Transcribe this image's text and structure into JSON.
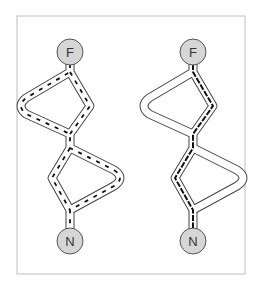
{
  "colors": {
    "frame": "#bdbdbd",
    "node_fill": "#d6d6d6",
    "node_stroke": "#555555",
    "tube": "#444444",
    "dash": "#111111"
  },
  "panels": [
    {
      "id": "left",
      "top_node": {
        "label": "F",
        "cx": 70,
        "cy": 52
      },
      "bottom_node": {
        "label": "N",
        "cx": 70,
        "cy": 241
      },
      "path": "M70 65 L70 76 L28 100 Q18 106 28 112 L70 130 L70 150 L112 172 Q122 178 112 184 L70 206 L70 228",
      "inner_path": "M70 76 L86 104 L70 130 M70 150 L56 178 L70 206",
      "dashed_route": "all"
    },
    {
      "id": "right",
      "top_node": {
        "label": "F",
        "cx": 193,
        "cy": 52
      },
      "bottom_node": {
        "label": "N",
        "cx": 193,
        "cy": 241
      },
      "path": "M193 65 L193 76 L151 100 Q141 106 151 112 L193 130 L193 150 L235 172 Q245 178 235 184 L193 206 L193 228",
      "inner_path": "M193 76 L209 104 L193 130 M193 150 L179 178 L193 206",
      "dashed_route": "spine"
    }
  ]
}
